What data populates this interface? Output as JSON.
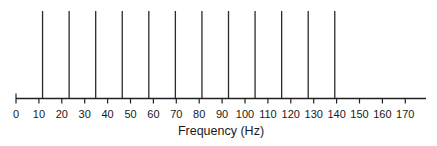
{
  "chart_data": {
    "type": "bar",
    "subtype": "line-spectrum",
    "title": "",
    "xlabel": "Frequency (Hz)",
    "ylabel": "",
    "xlim": [
      0,
      178
    ],
    "ylim": [
      0,
      1
    ],
    "grid": false,
    "legend": null,
    "x_ticks": [
      0,
      10,
      20,
      30,
      40,
      50,
      60,
      70,
      80,
      90,
      100,
      110,
      120,
      130,
      140,
      150,
      160,
      170
    ],
    "x_tick_labels": [
      "0",
      "10",
      "20",
      "30",
      "40",
      "50",
      "60",
      "70",
      "80",
      "90",
      "100",
      "110",
      "120",
      "130",
      "140",
      "150",
      "160",
      "170"
    ],
    "series": [
      {
        "name": "harmonics",
        "x": [
          11.6,
          23.2,
          34.8,
          46.4,
          58.0,
          69.6,
          81.2,
          92.8,
          104.4,
          116.0,
          127.6,
          139.2
        ],
        "values": [
          1,
          1,
          1,
          1,
          1,
          1,
          1,
          1,
          1,
          1,
          1,
          1
        ]
      }
    ],
    "annotations": []
  },
  "labels": {
    "xlabel": "Frequency (Hz)"
  }
}
